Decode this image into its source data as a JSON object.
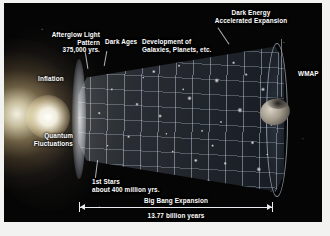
{
  "figure": {
    "background_color": "#050505",
    "text_color": "#ffffff"
  },
  "labels": {
    "afterglow": "Afterglow Light\nPattern\n375,000 yrs.",
    "dark_ages": "Dark Ages",
    "development": "Development of\nGalaxies, Planets, etc.",
    "dark_energy": "Dark Energy\nAccelerated Expansion",
    "inflation": "Inflation",
    "quantum": "Quantum\nFluctuations",
    "first_stars": "1st Stars\nabout 400 million yrs.",
    "wmap": "WMAP"
  },
  "timeline": {
    "caption": "Big Bang Expansion",
    "duration": "13.77 billion years"
  },
  "icons": {
    "satellite": "wmap-satellite-icon",
    "flash": "big-bang-flash-icon",
    "cone": "expansion-cone-icon"
  }
}
